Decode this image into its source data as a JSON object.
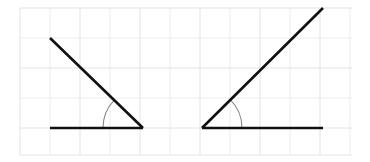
{
  "figure": {
    "width": 370,
    "height": 162,
    "background_color": "#ffffff"
  },
  "grid": {
    "visible": true,
    "x_start": 20,
    "y_start": 8,
    "x_end": 352,
    "y_end": 155,
    "cell_width": 30,
    "cell_height": 30,
    "minor_line_color": "#ededf1",
    "major_line_color": "#e2e2e8",
    "border_color": "#e4e4ea",
    "line_width": 1,
    "columns": 11,
    "rows": 5
  },
  "style": {
    "ray_color": "#111111",
    "ray_width": 2.6,
    "arc_color": "#8a8a8a",
    "arc_width": 1.1
  },
  "chart_data": {
    "type": "diagram",
    "subtype": "angle-pair",
    "units": "degrees",
    "coordinate_space": "pixels, origin top-left",
    "angles": [
      {
        "name": "left-angle",
        "label": "Angle A",
        "vertex": [
          143,
          128
        ],
        "rays": [
          {
            "name": "horizontal-ray",
            "from": [
              143,
              128
            ],
            "to": [
              50,
              128
            ],
            "direction": "left",
            "length_px": 93
          },
          {
            "name": "diagonal-ray",
            "from": [
              143,
              128
            ],
            "to": [
              50,
              38
            ],
            "direction": "up-left",
            "length_px": 129
          }
        ],
        "opening": "left",
        "measure_deg": 44,
        "arc": {
          "radius": 40,
          "start_deg": 180,
          "end_deg": 136,
          "color": "#8a8a8a"
        }
      },
      {
        "name": "right-angle",
        "label": "Angle B",
        "vertex": [
          202,
          128
        ],
        "rays": [
          {
            "name": "horizontal-ray",
            "from": [
              202,
              128
            ],
            "to": [
              323,
              128
            ],
            "direction": "right",
            "length_px": 121
          },
          {
            "name": "diagonal-ray",
            "from": [
              202,
              128
            ],
            "to": [
              323,
              8
            ],
            "direction": "up-right",
            "length_px": 170
          }
        ],
        "opening": "right",
        "measure_deg": 45,
        "arc": {
          "radius": 40,
          "start_deg": 0,
          "end_deg": 45,
          "color": "#8a8a8a"
        }
      }
    ]
  }
}
